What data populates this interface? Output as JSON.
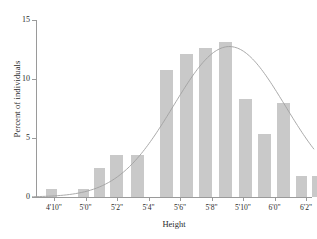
{
  "chart_data": {
    "type": "bar",
    "title": "",
    "subtitle": "",
    "xlabel": "Height",
    "ylabel": "Percent of individuals",
    "ylim": [
      0,
      15
    ],
    "yticks": [
      0,
      5,
      10,
      15
    ],
    "ytick_labels": [
      "0",
      "5",
      "10",
      "15"
    ],
    "xtick_labels": [
      "4'10\"",
      "5'0\"",
      "5'2\"",
      "5'4\"",
      "5'6\"",
      "5'8\"",
      "5'10\"",
      "6'0\"",
      "6'2\""
    ],
    "grid": false,
    "legend": null,
    "bar_color": "#c9c9c9",
    "curve_color": "#a0a0a0",
    "axis_color": "#9a9a9a",
    "categories": [
      "4'10\"",
      "4'11\"",
      "5'0\"",
      "5'1\"",
      "5'2\"",
      "5'3\"",
      "5'4\"",
      "5'5\"",
      "5'6\"",
      "5'7\"",
      "5'8\"",
      "5'9\"",
      "5'10\"",
      "5'11\"",
      "6'0\"",
      "6'1\"",
      "6'2\""
    ],
    "values": [
      0.7,
      0.0,
      0.7,
      2.5,
      3.6,
      3.6,
      0.0,
      10.8,
      12.1,
      12.6,
      13.1,
      8.3,
      5.3,
      8.0,
      1.8,
      1.8,
      0.3
    ],
    "series": [
      {
        "name": "Percent of individuals",
        "values": [
          0.7,
          0.0,
          0.7,
          2.5,
          3.6,
          3.6,
          0.0,
          10.8,
          12.1,
          12.6,
          13.1,
          8.3,
          5.3,
          8.0,
          1.8,
          1.8,
          0.3
        ]
      }
    ],
    "overlay_curve": {
      "name": "normal curve",
      "type": "line",
      "mean_index": 9.1,
      "peak_value": 12.75,
      "sigma_index": 2.85
    },
    "bars": [
      {
        "label": "4'10\"",
        "value": 0.7,
        "x": 10,
        "width": 11
      },
      {
        "label": "5'0\"",
        "value": 0.7,
        "x": 42,
        "width": 11
      },
      {
        "label": "5'1\"",
        "value": 2.5,
        "x": 58,
        "width": 11
      },
      {
        "label": "5'2\"",
        "value": 3.6,
        "x": 74,
        "width": 13
      },
      {
        "label": "5'3\"",
        "value": 3.6,
        "x": 95,
        "width": 13
      },
      {
        "label": "5'5\"",
        "value": 10.8,
        "x": 124,
        "width": 13
      },
      {
        "label": "5'6\"",
        "value": 12.1,
        "x": 144,
        "width": 13
      },
      {
        "label": "5'7\"",
        "value": 12.6,
        "x": 163,
        "width": 13
      },
      {
        "label": "5'8\"",
        "value": 13.1,
        "x": 183,
        "width": 13
      },
      {
        "label": "5'9\"",
        "value": 8.3,
        "x": 203,
        "width": 13
      },
      {
        "label": "5'10\"",
        "value": 5.3,
        "x": 222,
        "width": 13
      },
      {
        "label": "5'11\"",
        "value": 8.0,
        "x": 241,
        "width": 13
      },
      {
        "label": "6'0\"",
        "value": 1.8,
        "x": 260,
        "width": 11
      },
      {
        "label": "6'1\"",
        "value": 1.8,
        "x": 276,
        "width": 11
      },
      {
        "label": "6'2\"",
        "value": 0.3,
        "x": 292,
        "width": 11
      }
    ]
  }
}
